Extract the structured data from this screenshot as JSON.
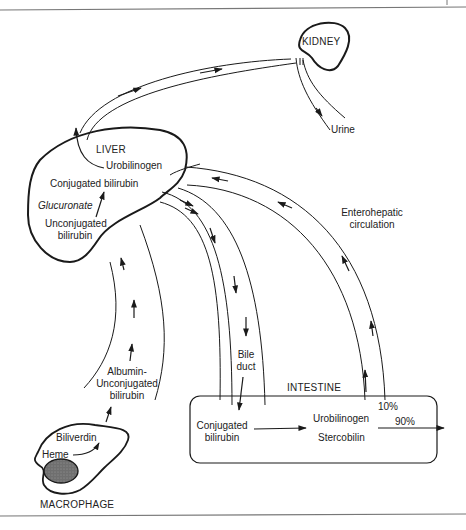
{
  "diagram": {
    "organs": {
      "kidney": "KIDNEY",
      "liver": "LIVER",
      "intestine": "INTESTINE",
      "macrophage": "MACROPHAGE"
    },
    "kidney": {
      "output": "Urine"
    },
    "liver": {
      "urobilinogen": "Urobilinogen",
      "conjugated": "Conjugated bilirubin",
      "glucuronate": "Glucuronate",
      "unconjugated_line1": "Unconjugated",
      "unconjugated_line2": "bilirubin"
    },
    "blood": {
      "albumin_line1": "Albumin-",
      "albumin_line2": "Unconjugated",
      "albumin_line3": "bilirubin"
    },
    "bile_duct": {
      "line1": "Bile",
      "line2": "duct"
    },
    "enterohepatic": {
      "line1": "Enterohepatic",
      "line2": "circulation"
    },
    "intestine": {
      "conjugated_line1": "Conjugated",
      "conjugated_line2": "bilirubin",
      "urobilinogen": "Urobilinogen",
      "stercobilin": "Stercobilin",
      "reabsorbed_pct": "10%",
      "excreted_pct": "90%"
    },
    "macrophage": {
      "biliverdin": "Biliverdin",
      "heme": "Heme"
    },
    "colors": {
      "line": "#1a1a1a",
      "nucleus": "#6f6f6f",
      "frame": "#777777"
    }
  }
}
